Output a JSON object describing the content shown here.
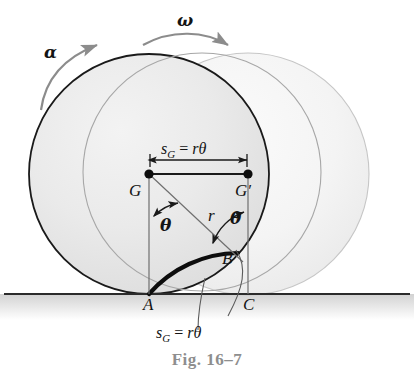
{
  "figure": {
    "caption": "Fig. 16–7",
    "domain_note": "rolling disk kinematics diagram"
  },
  "labels": {
    "alpha": "α",
    "omega": "ω",
    "center_initial": "G",
    "center_final": "G′",
    "contact_initial": "A",
    "contact_arc": "B",
    "contact_final": "C",
    "radius": "r",
    "theta_left": "θ",
    "theta_right": "θ",
    "s_symbol": "s",
    "s_subscript": "G",
    "equals": "=",
    "r_theta": "rθ"
  },
  "annotations": {
    "displacement_top": "s_G = rθ",
    "arc_length_bottom": "s_G = rθ"
  },
  "colors": {
    "dark_outline": "#1a1a1a",
    "light_outline": "#b8b8b8",
    "mid_outline": "#8a8a8a",
    "disk_fill": "#ededed",
    "disk_fill_light": "#f6f6f6",
    "ground_line": "#2b2b2b",
    "ground_shadow": "#d8d8d8",
    "arrow_gray": "#8c8c8c",
    "caption_gray": "#8e8e8e",
    "text_black": "#141414"
  },
  "geometry": {
    "center_initial_xy": [
      149,
      174
    ],
    "center_final_xy": [
      248,
      174
    ],
    "radius": 120,
    "ground_y": 294
  }
}
